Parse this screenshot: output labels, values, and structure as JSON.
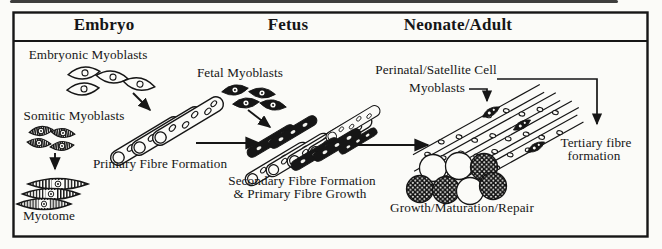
{
  "figure": {
    "stages": {
      "embryo": "Embryo",
      "fetus": "Fetus",
      "neonate_adult": "Neonate/Adult"
    },
    "labels": {
      "embryonic_myoblasts": "Embryonic Myoblasts",
      "somitic_myoblasts": "Somitic Myoblasts",
      "myotome": "Myotome",
      "primary_fibre_formation": "Primary Fibre Formation",
      "fetal_myoblasts": "Fetal Myoblasts",
      "secondary_fibre_line1": "Secondary Fibre Formation",
      "secondary_fibre_line2": "& Primary Fibre Growth",
      "perinatal_line1": "Perinatal/Satellite Cell",
      "perinatal_line2": "Myoblasts",
      "growth_maturation_repair": "Growth/Maturation/Repair",
      "tertiary_line1": "Tertiary fibre",
      "tertiary_line2": "formation"
    },
    "colors": {
      "ink": "#161616",
      "paper": "#fbfbf8"
    }
  }
}
